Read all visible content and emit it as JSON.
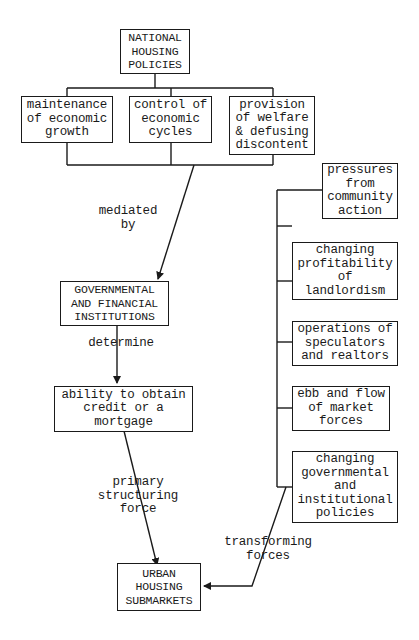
{
  "diagram": {
    "top": {
      "label": "NATIONAL\nHOUSING\nPOLICIES"
    },
    "goals": [
      {
        "label": "maintenance\nof economic\ngrowth"
      },
      {
        "label": "control of\neconomic\ncycles"
      },
      {
        "label": "provision\nof welfare\n& defusing\ndiscontent"
      }
    ],
    "institutions": {
      "label": "GOVERNMENTAL\nAND FINANCIAL\nINSTITUTIONS"
    },
    "credit": {
      "label": "ability to obtain\ncredit or a\nmortgage"
    },
    "submarkets": {
      "label": "URBAN\nHOUSING\nSUBMARKETS"
    },
    "edges": {
      "mediated": "mediated\nby",
      "determine": "determine",
      "primary": "primary\nstructuring\nforce",
      "transforming": "transforming\nforces"
    },
    "forces": [
      {
        "label": "pressures\nfrom\ncommunity\naction"
      },
      {
        "label": "changing\nprofitability\nof\nlandlordism"
      },
      {
        "label": "operations of\nspeculators\nand realtors"
      },
      {
        "label": "ebb and flow\nof market\nforces"
      },
      {
        "label": "changing\ngovernmental\nand\ninstitutional\npolicies"
      }
    ]
  }
}
